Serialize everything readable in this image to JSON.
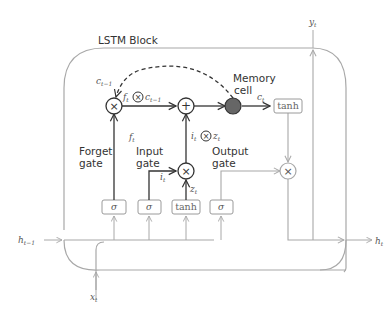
{
  "diagram": {
    "title": "LSTM Block",
    "labels": {
      "forget_gate": [
        "Forget",
        "gate"
      ],
      "input_gate": [
        "Input",
        "gate"
      ],
      "output_gate": [
        "Output",
        "gate"
      ],
      "memory_cell": [
        "Memory",
        "cell"
      ]
    },
    "math": {
      "c_prev_top": "c",
      "c_prev_top_sub": "t−1",
      "ft_mul_c": "f",
      "ft_mul_c_sub": "t",
      "c_after": "c",
      "c_after_sub": "t−1",
      "ft": "f",
      "ft_sub": "t",
      "it_mul_zt_i": "i",
      "it_mul_zt_i_sub": "t",
      "it_mul_zt_z": "z",
      "it_mul_zt_z_sub": "t",
      "it": "i",
      "it_sub": "t",
      "zt": "z",
      "zt_sub": "t",
      "ct": "c",
      "ct_sub": "t",
      "yt": "y",
      "yt_sub": "t",
      "ht_prev": "h",
      "ht_prev_sub": "t−1",
      "ht": "h",
      "ht_sub": "t",
      "xt": "x",
      "xt_sub": "t"
    },
    "boxes": {
      "forget_sigma": "σ",
      "input_sigma": "σ",
      "input_tanh": "tanh",
      "output_sigma": "σ",
      "cell_tanh": "tanh"
    },
    "operators": {
      "multiply": "×",
      "add": "+"
    },
    "colors": {
      "dark_line": "#333333",
      "light_line": "#a8a8a8",
      "memory_cell_fill": "#666666",
      "box_border": "#9a9a9a"
    }
  }
}
